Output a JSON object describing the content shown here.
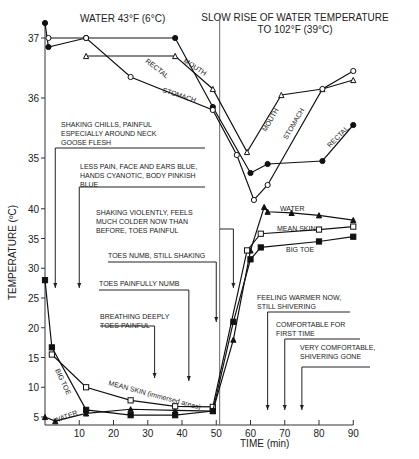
{
  "chart_data": {
    "type": "line",
    "title_left": "WATER 43°F (6°C)",
    "title_right_line1": "SLOW RISE OF WATER TEMPERATURE",
    "title_right_line2": "TO 102°F (39°C)",
    "xlabel": "TIME (min)",
    "ylabel": "TEMPERATURE (ºC)",
    "xlim": [
      0,
      90
    ],
    "x_ticks": [
      10,
      20,
      30,
      40,
      50,
      60,
      70,
      80,
      90
    ],
    "upper_panel": {
      "ylim": [
        34.3,
        37.3
      ],
      "y_ticks": [
        35,
        36,
        37
      ],
      "series": [
        {
          "name": "RECTAL",
          "marker": "filled-circle",
          "x": [
            0,
            1,
            12,
            38,
            49,
            60,
            65,
            81,
            90
          ],
          "y": [
            37.25,
            36.85,
            37.0,
            37.0,
            35.85,
            34.75,
            34.9,
            34.95,
            35.55
          ]
        },
        {
          "name": "MOUTH",
          "marker": "open-triangle",
          "x": [
            12,
            38,
            49,
            59,
            69,
            81,
            90
          ],
          "y": [
            36.7,
            36.7,
            36.15,
            35.1,
            36.05,
            36.15,
            36.3
          ]
        },
        {
          "name": "STOMACH",
          "marker": "open-circle",
          "x": [
            1,
            12,
            25,
            49,
            56,
            61,
            65,
            81,
            90
          ],
          "y": [
            37.0,
            37.0,
            36.35,
            35.8,
            35.05,
            34.3,
            34.55,
            36.15,
            36.45
          ]
        }
      ]
    },
    "lower_panel": {
      "ylim": [
        4,
        42
      ],
      "y_ticks": [
        5,
        10,
        15,
        20,
        25,
        30,
        35,
        40
      ],
      "series": [
        {
          "name": "WATER",
          "marker": "filled-triangle",
          "x": [
            0,
            3,
            12,
            25,
            38,
            49,
            55,
            60,
            64,
            65,
            72,
            80,
            90
          ],
          "y": [
            5.0,
            4.3,
            5.6,
            6.3,
            6.1,
            6.0,
            18.0,
            33.0,
            40.3,
            39.5,
            39.3,
            38.9,
            38.1
          ]
        },
        {
          "name": "MEAN SKIN",
          "marker": "open-square",
          "label_detail": "(immersed areas)",
          "x": [
            2,
            12,
            25,
            38,
            49,
            59,
            63,
            80,
            90
          ],
          "y": [
            15.5,
            10.0,
            7.8,
            6.8,
            6.7,
            33.0,
            35.8,
            36.5,
            37.0
          ]
        },
        {
          "name": "BIG TOE",
          "marker": "filled-square",
          "x": [
            0,
            2,
            12,
            25,
            38,
            49,
            55,
            60,
            63,
            80,
            90
          ],
          "y": [
            28.0,
            16.7,
            6.2,
            5.3,
            5.3,
            6.0,
            21.0,
            31.5,
            33.5,
            34.5,
            35.3
          ]
        }
      ]
    },
    "annotations": [
      {
        "lines": [
          "SHAKING CHILLS, PAINFUL",
          "ESPECIALLY AROUND NECK",
          "GOOSE FLESH"
        ],
        "arrow_time": 3
      },
      {
        "lines": [
          "LESS PAIN, FACE AND EARS BLUE,",
          "HANDS CYANOTIC, BODY PINKISH",
          "BLUE"
        ],
        "arrow_time": 10
      },
      {
        "lines": [
          "SHAKING VIOLENTLY, FEELS",
          "MUCH COLDER NOW THAN",
          "BEFORE, TOES PAINFUL"
        ],
        "arrow_time": 55
      },
      {
        "lines": [
          "TOES NUMB, STILL SHAKING"
        ],
        "arrow_time": 50
      },
      {
        "lines": [
          "TOES PAINFULLY NUMB"
        ],
        "arrow_time": 42
      },
      {
        "lines": [
          "BREATHING DEEPLY",
          "TOES PAINFUL"
        ],
        "arrow_time": 32
      },
      {
        "lines": [
          "FEELING WARMER NOW,",
          "STILL SHIVERING"
        ],
        "arrow_time": 65
      },
      {
        "lines": [
          "COMFORTABLE FOR",
          "FIRST TIME"
        ],
        "arrow_time": 70
      },
      {
        "lines": [
          "VERY COMFORTABLE,",
          "SHIVERING GONE"
        ],
        "arrow_time": 75
      }
    ],
    "grid": false,
    "legend_position": "inline labels"
  }
}
